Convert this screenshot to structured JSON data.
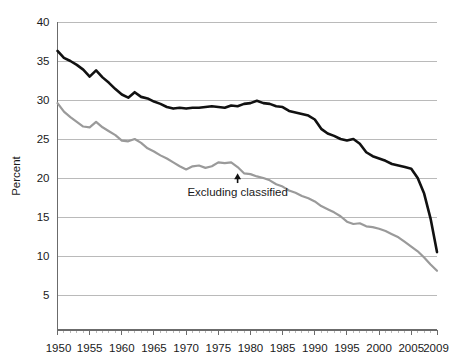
{
  "chart_data": {
    "type": "line",
    "title": "",
    "subtitle": "",
    "xlabel": "",
    "ylabel": "Percent",
    "xlim": [
      1950,
      2009
    ],
    "ylim": [
      0,
      40
    ],
    "grid": true,
    "legend_position": "none",
    "y_ticks": [
      5,
      10,
      15,
      20,
      25,
      30,
      35,
      40
    ],
    "y_tick_labels": [
      "5",
      "10",
      "15",
      "20",
      "25",
      "30",
      "35",
      "40"
    ],
    "x_ticks": [
      1950,
      1955,
      1960,
      1965,
      1970,
      1975,
      1980,
      1985,
      1990,
      1995,
      2000,
      2005,
      2009
    ],
    "x_tick_labels": [
      "1950",
      "1955",
      "1960",
      "1965",
      "1970",
      "1975",
      "1980",
      "1985",
      "1990",
      "1995",
      "2000",
      "2005",
      "2009"
    ],
    "x": [
      1950,
      1951,
      1952,
      1953,
      1954,
      1955,
      1956,
      1957,
      1958,
      1959,
      1960,
      1961,
      1962,
      1963,
      1964,
      1965,
      1966,
      1967,
      1968,
      1969,
      1970,
      1971,
      1972,
      1973,
      1974,
      1975,
      1976,
      1977,
      1978,
      1979,
      1980,
      1981,
      1982,
      1983,
      1984,
      1985,
      1986,
      1987,
      1988,
      1989,
      1990,
      1991,
      1992,
      1993,
      1994,
      1995,
      1996,
      1997,
      1998,
      1999,
      2000,
      2001,
      2002,
      2003,
      2004,
      2005,
      2006,
      2007,
      2008,
      2009
    ],
    "series": [
      {
        "name": "Total",
        "color": "#111111",
        "width": 2.6,
        "values": [
          36.3,
          35.4,
          35.0,
          34.5,
          33.9,
          33.0,
          33.8,
          32.9,
          32.2,
          31.4,
          30.7,
          30.3,
          31.0,
          30.4,
          30.2,
          29.8,
          29.5,
          29.1,
          28.9,
          29.0,
          28.9,
          29.0,
          29.0,
          29.1,
          29.2,
          29.1,
          29.0,
          29.3,
          29.2,
          29.5,
          29.6,
          29.9,
          29.6,
          29.5,
          29.2,
          29.1,
          28.6,
          28.4,
          28.2,
          28.0,
          27.5,
          26.3,
          25.7,
          25.4,
          25.0,
          24.8,
          25.0,
          24.4,
          23.3,
          22.8,
          22.5,
          22.2,
          21.8,
          21.6,
          21.4,
          21.2,
          20.0,
          18.0,
          14.8,
          10.5
        ]
      },
      {
        "name": "Excluding classified",
        "color": "#9a9a9a",
        "width": 2.2,
        "values": [
          29.6,
          28.5,
          27.8,
          27.2,
          26.6,
          26.5,
          27.2,
          26.5,
          26.0,
          25.5,
          24.8,
          24.7,
          25.0,
          24.5,
          23.8,
          23.4,
          22.9,
          22.5,
          22.0,
          21.5,
          21.1,
          21.5,
          21.6,
          21.3,
          21.5,
          22.0,
          21.9,
          22.0,
          21.4,
          20.6,
          20.5,
          20.2,
          20.0,
          19.7,
          19.2,
          18.9,
          18.4,
          18.1,
          17.7,
          17.4,
          17.0,
          16.4,
          16.0,
          15.6,
          15.1,
          14.4,
          14.1,
          14.2,
          13.8,
          13.7,
          13.5,
          13.2,
          12.8,
          12.4,
          11.8,
          11.2,
          10.6,
          9.8,
          8.9,
          8.1
        ]
      }
    ],
    "annotations": [
      {
        "text": "Excluding classified",
        "x": 1978,
        "y": 18.2,
        "arrow": "up-arrow",
        "arrow_target_y": 20.6
      }
    ]
  },
  "axes": {
    "y_axis_title": "Percent"
  }
}
